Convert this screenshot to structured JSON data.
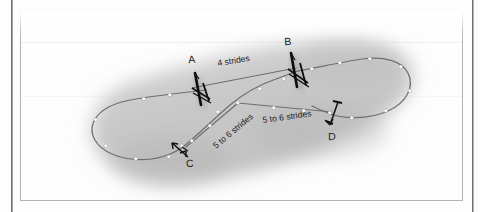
{
  "page": {
    "type": "scanned-book-figure",
    "background_color": "#ffffff",
    "frame_color": "#b3b3b3"
  },
  "figure": {
    "surface_color": "#c9c9c9",
    "track_color": "#6f6f6f",
    "marker_color": "#ffffff",
    "fence_color": "#111111",
    "fences": [
      {
        "id": "A",
        "label": "A"
      },
      {
        "id": "B",
        "label": "B"
      },
      {
        "id": "C",
        "label": "C"
      },
      {
        "id": "D",
        "label": "D"
      }
    ],
    "distances": [
      {
        "id": "ab",
        "label": "4 strides"
      },
      {
        "id": "bc",
        "label": "5 to 6 strides"
      },
      {
        "id": "cd",
        "label": "5 to 6 strides"
      }
    ]
  }
}
